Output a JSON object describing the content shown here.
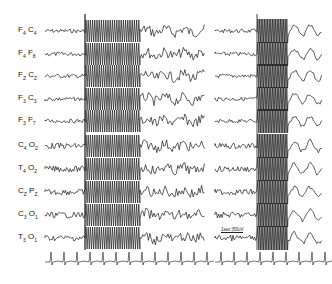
{
  "figure": {
    "type": "EEG recording",
    "channels": [
      {
        "label_a": "F",
        "sub_a": "4",
        "label_b": "C",
        "sub_b": "4",
        "y": 31
      },
      {
        "label_a": "F",
        "sub_a": "4",
        "label_b": "F",
        "sub_b": "8",
        "y": 54
      },
      {
        "label_a": "F",
        "sub_a": "Z",
        "label_b": "C",
        "sub_b": "Z",
        "y": 76
      },
      {
        "label_a": "F",
        "sub_a": "3",
        "label_b": "C",
        "sub_b": "3",
        "y": 99
      },
      {
        "label_a": "F",
        "sub_a": "3",
        "label_b": "F",
        "sub_b": "7",
        "y": 121
      },
      {
        "label_a": "C",
        "sub_a": "4",
        "label_b": "O",
        "sub_b": "2",
        "y": 146
      },
      {
        "label_a": "T",
        "sub_a": "4",
        "label_b": "O",
        "sub_b": "2",
        "y": 169
      },
      {
        "label_a": "C",
        "sub_a": "Z",
        "label_b": "P",
        "sub_b": "Z",
        "y": 192
      },
      {
        "label_a": "C",
        "sub_a": "3",
        "label_b": "O",
        "sub_b": "1",
        "y": 215
      },
      {
        "label_a": "T",
        "sub_a": "3",
        "label_b": "O",
        "sub_b": "1",
        "y": 238
      }
    ],
    "ecg_y": 262,
    "scale_bar": "1sec |50uV",
    "trace_color": "#1a1a1a"
  }
}
